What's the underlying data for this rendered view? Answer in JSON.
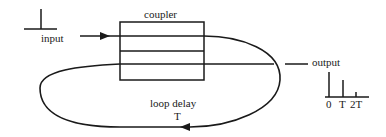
{
  "diagram": {
    "type": "fiber recirculating delay line",
    "labels": {
      "coupler": "coupler",
      "input": "input",
      "output": "output",
      "loop_delay": "loop delay",
      "loop_delay_symbol": "T"
    },
    "output_axis_ticks": [
      "0",
      "T",
      "2T"
    ],
    "output_pulses": [
      {
        "time": "0",
        "relative_height": 1.0
      },
      {
        "time": "T",
        "relative_height": 0.7
      },
      {
        "time": "2T",
        "relative_height": 0.2
      }
    ],
    "input_pulse": {
      "relative_height": 1.0
    },
    "colors": {
      "ink": "#1a1a1a",
      "background": "#ffffff"
    }
  }
}
